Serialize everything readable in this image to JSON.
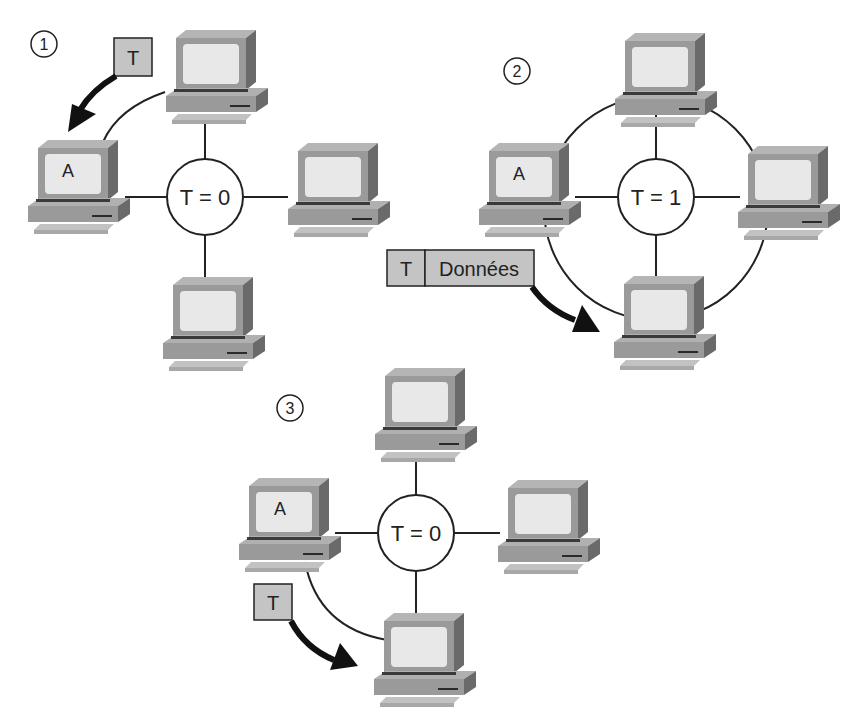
{
  "colors": {
    "background": "#ffffff",
    "line": "#222222",
    "pc_body": "#9a9a9a",
    "pc_dark": "#6e6e6e",
    "pc_light": "#b9b9b9",
    "screen": "#e6e6e6",
    "token_box": "#c4c4c4",
    "arrow": "#111111"
  },
  "panels": [
    {
      "step": "1",
      "hub_label": "T = 0",
      "station_label": "A",
      "token_label": "T"
    },
    {
      "step": "2",
      "hub_label": "T = 1",
      "station_label": "A",
      "frame": {
        "token": "T",
        "data": "Données"
      }
    },
    {
      "step": "3",
      "hub_label": "T = 0",
      "station_label": "A",
      "token_label": "T"
    }
  ]
}
